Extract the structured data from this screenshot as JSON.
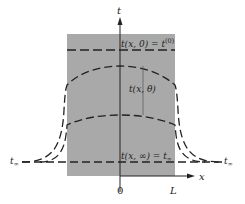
{
  "diagram": {
    "axes": {
      "vertical_label": "t",
      "horizontal_label": "x",
      "origin_label": "0",
      "slab_end_label": "L"
    },
    "labels": {
      "initial": "t(x, 0) = t",
      "initial_sup": "(0)",
      "intermediate": "t(x, θ)",
      "final": "t(x, ∞) = t",
      "final_sub": "∞",
      "ambient_left": "t",
      "ambient_left_sub": "∞",
      "ambient_right": "t",
      "ambient_right_sub": "∞"
    },
    "colors": {
      "slab_fill": "#a9a9a9",
      "line": "#222222",
      "background": "#ffffff"
    },
    "curves": [
      {
        "name": "initial-profile",
        "description": "uniform initial temperature t(0)"
      },
      {
        "name": "intermediate-profile-1",
        "description": "early time t(x,θ)"
      },
      {
        "name": "intermediate-profile-2",
        "description": "later time t(x,θ)"
      },
      {
        "name": "final-profile",
        "description": "steady state t∞"
      }
    ]
  }
}
